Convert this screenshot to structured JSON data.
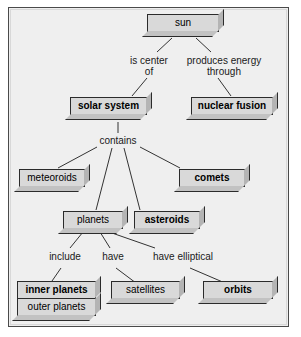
{
  "diagram": {
    "type": "concept-map",
    "colors": {
      "canvas": "#ffffff",
      "frame_background": "#efefef",
      "frame_border": "#4a4a4a",
      "node_face": "#d9d9d9",
      "node_border": "#2b2b2b",
      "node_extrude_right": "#b4b4b4",
      "node_extrude_bottom": "#c2c2c2",
      "connector": "#333333",
      "text": "#000000"
    },
    "nodes": [
      {
        "id": "sun",
        "label": "sun",
        "bold": false
      },
      {
        "id": "solar-system",
        "label": "solar system",
        "bold": true
      },
      {
        "id": "nuclear-fusion",
        "label": "nuclear fusion",
        "bold": true
      },
      {
        "id": "meteoroids",
        "label": "meteoroids",
        "bold": false
      },
      {
        "id": "comets",
        "label": "comets",
        "bold": true
      },
      {
        "id": "planets",
        "label": "planets",
        "bold": false
      },
      {
        "id": "asteroids",
        "label": "asteroids",
        "bold": true
      },
      {
        "id": "inner-planets",
        "label": "inner planets",
        "bold": true
      },
      {
        "id": "outer-planets",
        "label": "outer planets",
        "bold": false
      },
      {
        "id": "satellites",
        "label": "satellites",
        "bold": false
      },
      {
        "id": "orbits",
        "label": "orbits",
        "bold": true
      }
    ],
    "link_labels": [
      {
        "id": "is-center-of",
        "text": "is center\nof",
        "from": "sun",
        "to": "solar-system"
      },
      {
        "id": "produces-energy-through",
        "text": "produces energy\nthrough",
        "from": "sun",
        "to": "nuclear-fusion"
      },
      {
        "id": "contains",
        "text": "contains",
        "from": "solar-system",
        "to": "meteoroids, comets, planets, asteroids"
      },
      {
        "id": "include",
        "text": "include",
        "from": "planets",
        "to": "inner planets / outer planets"
      },
      {
        "id": "have",
        "text": "have",
        "from": "planets",
        "to": "satellites"
      },
      {
        "id": "have-elliptical",
        "text": "have elliptical",
        "from": "planets",
        "to": "orbits"
      }
    ]
  }
}
